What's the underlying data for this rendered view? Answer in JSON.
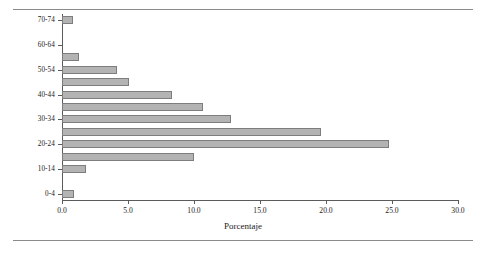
{
  "chart_data": {
    "type": "bar",
    "orientation": "horizontal",
    "title": "",
    "xlabel": "Porcentaje",
    "ylabel": "Grupos de edad",
    "xlim": [
      0.0,
      30.0
    ],
    "xticks": [
      "0.0",
      "5.0",
      "10.0",
      "15.0",
      "20.0",
      "25.0",
      "30.0"
    ],
    "xtick_values": [
      0,
      5,
      10,
      15,
      20,
      25,
      30
    ],
    "ytick_labels": [
      "70-74",
      "60-64",
      "50-54",
      "40-44",
      "30-34",
      "20-24",
      "10-14",
      "0-4"
    ],
    "grid": false,
    "legend": null,
    "bar_color": "#b3b3b3",
    "bar_edge_color": "#7d7d7d",
    "axis_color": "#5b5b5b",
    "categories": [
      "70-74",
      "65-69",
      "60-64",
      "55-59",
      "50-54",
      "45-49",
      "40-44",
      "35-39",
      "30-34",
      "25-29",
      "20-24",
      "15-19",
      "10-14",
      "5-9",
      "0-4"
    ],
    "values": [
      0.8,
      0.0,
      0.0,
      1.3,
      4.2,
      5.1,
      8.3,
      10.7,
      12.8,
      19.6,
      24.8,
      10.0,
      1.8,
      0.0,
      0.9
    ]
  }
}
